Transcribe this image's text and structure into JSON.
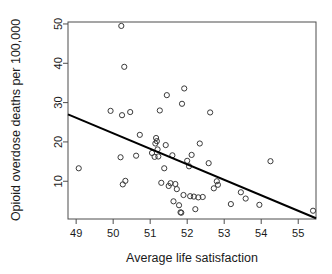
{
  "chart_data": {
    "type": "scatter",
    "title": "",
    "xlabel": "Average life satisfaction",
    "ylabel": "Opioid overdose deaths per 100,000",
    "xlim": [
      48.78,
      55.48
    ],
    "ylim": [
      0.4,
      50.5
    ],
    "xticks": [
      49,
      50,
      51,
      52,
      53,
      54,
      55
    ],
    "xtick_labels": [
      "49",
      "50",
      "51",
      "52",
      "53",
      "54",
      "55"
    ],
    "yticks": [
      10,
      20,
      30,
      40,
      50
    ],
    "ytick_labels": [
      "10",
      "20",
      "30",
      "40",
      "50"
    ],
    "grid": false,
    "legend": null,
    "marker": "open-circle",
    "point_color": "#3a3a3a",
    "line_color": "#000000",
    "axis_color": "#4d4d4d",
    "points": [
      [
        49.07,
        13.3
      ],
      [
        49.93,
        27.9
      ],
      [
        50.22,
        49.5
      ],
      [
        50.2,
        16.1
      ],
      [
        50.24,
        26.8
      ],
      [
        50.26,
        9.2
      ],
      [
        50.3,
        39.1
      ],
      [
        50.33,
        10.1
      ],
      [
        50.46,
        27.6
      ],
      [
        50.62,
        16.5
      ],
      [
        50.72,
        21.8
      ],
      [
        51.05,
        17.2
      ],
      [
        51.12,
        16.2
      ],
      [
        51.14,
        19.6
      ],
      [
        51.16,
        21.0
      ],
      [
        51.18,
        20.2
      ],
      [
        51.2,
        18.1
      ],
      [
        51.22,
        16.3
      ],
      [
        51.26,
        28.0
      ],
      [
        51.3,
        9.6
      ],
      [
        51.38,
        13.3
      ],
      [
        51.42,
        19.2
      ],
      [
        51.45,
        31.9
      ],
      [
        51.5,
        8.8
      ],
      [
        51.55,
        9.5
      ],
      [
        51.6,
        16.6
      ],
      [
        51.63,
        4.9
      ],
      [
        51.68,
        9.3
      ],
      [
        51.72,
        8.0
      ],
      [
        51.78,
        3.9
      ],
      [
        51.82,
        2.1
      ],
      [
        51.84,
        2.0
      ],
      [
        51.86,
        29.7
      ],
      [
        51.9,
        6.5
      ],
      [
        51.92,
        33.6
      ],
      [
        52.0,
        15.2
      ],
      [
        52.05,
        13.8
      ],
      [
        52.08,
        6.2
      ],
      [
        52.12,
        16.7
      ],
      [
        52.18,
        6.1
      ],
      [
        52.22,
        2.9
      ],
      [
        52.3,
        5.9
      ],
      [
        52.34,
        19.6
      ],
      [
        52.42,
        6.0
      ],
      [
        52.58,
        14.6
      ],
      [
        52.62,
        27.5
      ],
      [
        52.72,
        8.2
      ],
      [
        52.8,
        10.0
      ],
      [
        52.83,
        9.1
      ],
      [
        53.18,
        4.2
      ],
      [
        53.45,
        7.2
      ],
      [
        53.58,
        5.6
      ],
      [
        53.95,
        4.0
      ],
      [
        54.25,
        15.1
      ],
      [
        55.4,
        2.5
      ]
    ],
    "fit_line": {
      "label": "linear-fit",
      "x1": 48.78,
      "y1": 27.0,
      "x2": 55.48,
      "y2": 0.6
    }
  }
}
